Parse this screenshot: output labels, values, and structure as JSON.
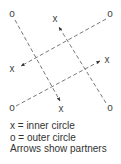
{
  "diagram": {
    "markers": [
      {
        "symbol": "o",
        "role": "outer",
        "x": 12,
        "y": 17,
        "name": "outer-top-left"
      },
      {
        "symbol": "x",
        "role": "inner",
        "x": 55,
        "y": 22,
        "name": "inner-top"
      },
      {
        "symbol": "o",
        "role": "outer",
        "x": 110,
        "y": 17,
        "name": "outer-top-right"
      },
      {
        "symbol": "x",
        "role": "inner",
        "x": 12,
        "y": 72,
        "name": "inner-left"
      },
      {
        "symbol": "x",
        "role": "inner",
        "x": 107,
        "y": 63,
        "name": "inner-right"
      },
      {
        "symbol": "o",
        "role": "outer",
        "x": 12,
        "y": 111,
        "name": "outer-bottom-left"
      },
      {
        "symbol": "x",
        "role": "inner",
        "x": 61,
        "y": 112,
        "name": "inner-bottom"
      },
      {
        "symbol": "o",
        "role": "outer",
        "x": 110,
        "y": 111,
        "name": "outer-bottom-right"
      }
    ],
    "arrows": [
      {
        "from": "outer-top-left",
        "to": "inner-bottom",
        "x1": 15,
        "y1": 20,
        "x2": 60,
        "y2": 101
      },
      {
        "from": "outer-bottom-right",
        "to": "inner-top",
        "x1": 106,
        "y1": 103,
        "x2": 59,
        "y2": 27
      },
      {
        "from": "outer-top-right",
        "to": "inner-left",
        "x1": 106,
        "y1": 19,
        "x2": 21,
        "y2": 66
      },
      {
        "from": "outer-bottom-left",
        "to": "inner-right",
        "x1": 16,
        "y1": 106,
        "x2": 100,
        "y2": 61
      }
    ],
    "line_color": "#555555"
  },
  "legend": {
    "items": [
      {
        "label": "x  =  inner circle"
      },
      {
        "label": "o  =  outer circle"
      },
      {
        "label": "Arrows show partners"
      }
    ]
  }
}
